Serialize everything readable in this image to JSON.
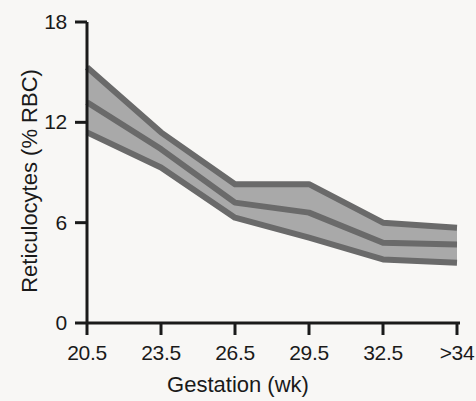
{
  "chart_data": {
    "type": "area",
    "title": "",
    "xlabel": "Gestation (wk)",
    "ylabel": "Reticulocytes (% RBC)",
    "categories": [
      "20.5",
      "23.5",
      "26.5",
      "29.5",
      "32.5",
      ">34"
    ],
    "x": [
      0,
      1,
      2,
      3,
      4,
      5
    ],
    "xlim": [
      0,
      5
    ],
    "ylim": [
      0,
      18
    ],
    "yticks": [
      0,
      6,
      12,
      18
    ],
    "ytick_labels": [
      "0",
      "6",
      "12",
      "18"
    ],
    "xtick_labels": [
      "20.5",
      "23.5",
      "26.5",
      "29.5",
      "32.5",
      ">34"
    ],
    "grid": false,
    "legend": "none",
    "band_fill_color": "#a9a9a9",
    "line_color": "#6a6a6a",
    "axis_color": "#1a1a1a",
    "background_color": "#f8f7f5",
    "series": [
      {
        "name": "Upper bound",
        "values": [
          15.3,
          11.4,
          8.3,
          8.3,
          6.0,
          5.7
        ]
      },
      {
        "name": "Median",
        "values": [
          13.2,
          10.4,
          7.2,
          6.6,
          4.8,
          4.7
        ]
      },
      {
        "name": "Lower bound",
        "values": [
          11.4,
          9.3,
          6.3,
          5.1,
          3.8,
          3.6
        ]
      }
    ],
    "annotations": []
  },
  "axes": {
    "y_title": "Reticulocytes (% RBC)",
    "x_title": "Gestation (wk)"
  }
}
